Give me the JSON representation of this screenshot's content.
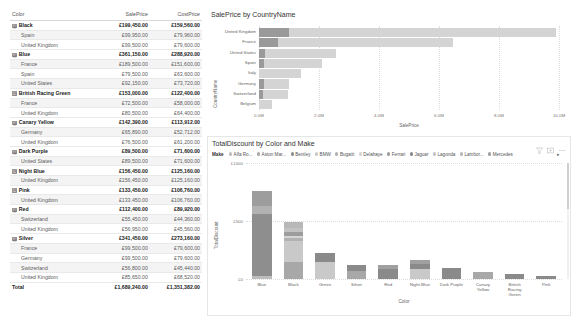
{
  "matrix": {
    "columns": [
      "Color",
      "SalePrice",
      "CostPrice"
    ],
    "rows": [
      {
        "type": "group",
        "label": "Black",
        "sale": "£199,450.00",
        "cost": "£159,560.00"
      },
      {
        "type": "sub",
        "label": "Spain",
        "sale": "£99,950.00",
        "cost": "£79,960.00"
      },
      {
        "type": "sub",
        "label": "United Kingdom",
        "sale": "£99,500.00",
        "cost": "£79,600.00"
      },
      {
        "type": "group",
        "label": "Blue",
        "sale": "£361,150.00",
        "cost": "£288,920.00"
      },
      {
        "type": "sub",
        "label": "France",
        "sale": "£189,500.00",
        "cost": "£151,600.00"
      },
      {
        "type": "sub",
        "label": "Spain",
        "sale": "£79,500.00",
        "cost": "£63,600.00"
      },
      {
        "type": "sub",
        "label": "United States",
        "sale": "£92,150.00",
        "cost": "£73,720.00"
      },
      {
        "type": "group",
        "label": "British Racing Green",
        "sale": "£153,000.00",
        "cost": "£122,400.00"
      },
      {
        "type": "sub",
        "label": "France",
        "sale": "£72,500.00",
        "cost": "£58,000.00"
      },
      {
        "type": "sub",
        "label": "United Kingdom",
        "sale": "£80,500.00",
        "cost": "£64,400.00"
      },
      {
        "type": "group",
        "label": "Canary Yellow",
        "sale": "£142,390.00",
        "cost": "£113,912.00"
      },
      {
        "type": "sub",
        "label": "Germany",
        "sale": "£65,890.00",
        "cost": "£52,712.00"
      },
      {
        "type": "sub",
        "label": "United Kingdom",
        "sale": "£76,500.00",
        "cost": "£61,200.00"
      },
      {
        "type": "group",
        "label": "Dark Purple",
        "sale": "£89,500.00",
        "cost": "£71,600.00"
      },
      {
        "type": "sub",
        "label": "United States",
        "sale": "£89,500.00",
        "cost": "£71,600.00"
      },
      {
        "type": "group",
        "label": "Night Blue",
        "sale": "£156,450.00",
        "cost": "£125,160.00"
      },
      {
        "type": "sub",
        "label": "United Kingdom",
        "sale": "£156,450.00",
        "cost": "£125,160.00"
      },
      {
        "type": "group",
        "label": "Pink",
        "sale": "£133,450.00",
        "cost": "£106,760.00"
      },
      {
        "type": "sub",
        "label": "United Kingdom",
        "sale": "£133,450.00",
        "cost": "£106,760.00"
      },
      {
        "type": "group",
        "label": "Red",
        "sale": "£112,400.00",
        "cost": "£89,920.00"
      },
      {
        "type": "sub",
        "label": "Switzerland",
        "sale": "£55,450.00",
        "cost": "£44,360.00"
      },
      {
        "type": "sub",
        "label": "United Kingdom",
        "sale": "£56,950.00",
        "cost": "£45,560.00"
      },
      {
        "type": "group",
        "label": "Silver",
        "sale": "£341,450.00",
        "cost": "£273,160.00"
      },
      {
        "type": "sub",
        "label": "France",
        "sale": "£99,500.00",
        "cost": "£79,600.00"
      },
      {
        "type": "sub",
        "label": "Germany",
        "sale": "£99,500.00",
        "cost": "£79,600.00"
      },
      {
        "type": "sub",
        "label": "Switzerland",
        "sale": "£56,800.00",
        "cost": "£45,440.00"
      },
      {
        "type": "sub",
        "label": "United Kingdom",
        "sale": "£85,650.00",
        "cost": "£68,520.00"
      },
      {
        "type": "total",
        "label": "Total",
        "sale": "£1,689,240.00",
        "cost": "£1,351,382.00"
      }
    ],
    "expander_glyph": "⊟"
  },
  "bar_visual": {
    "title": "SalePrice by CountryName",
    "chart_data": {
      "type": "bar",
      "orientation": "horizontal",
      "title": "SalePrice by CountryName",
      "xlabel": "SalePrice",
      "ylabel": "CountryName",
      "categories": [
        "United Kingdom",
        "France",
        "United States",
        "Spain",
        "Italy",
        "Germany",
        "Switzerland",
        "Belgium"
      ],
      "values": [
        9.9,
        6.45,
        2.55,
        2.1,
        1.4,
        1.0,
        0.95,
        0.42
      ],
      "highlight_values": [
        1.0,
        0.62,
        0.2,
        0.18,
        0.0,
        0.16,
        0.14,
        0.0
      ],
      "xlim": [
        0,
        10
      ],
      "xticks": [
        "0.0M",
        "2.0M",
        "4.0M",
        "6.0M",
        "8.0M",
        "10.0M"
      ],
      "xtick_values": [
        0,
        2,
        4,
        6,
        8,
        10
      ],
      "grid": true,
      "bar_color": "#d4d4d4",
      "highlight_color": "#9a9a9a"
    }
  },
  "column_visual": {
    "title": "TotalDiscount by Color and Make",
    "legend": {
      "title": "Make",
      "items": [
        {
          "label": "Alfa Ro...",
          "color": "#bdbdbd"
        },
        {
          "label": "Aston Mar...",
          "color": "#a8a8a8"
        },
        {
          "label": "Bentley",
          "color": "#8e8e8e"
        },
        {
          "label": "BMW",
          "color": "#c9c9c9"
        },
        {
          "label": "Bugatti",
          "color": "#b2b2b2"
        },
        {
          "label": "Delahaye",
          "color": "#d5d5d5"
        },
        {
          "label": "Ferrari",
          "color": "#9d9d9d"
        },
        {
          "label": "Jaguar",
          "color": "#8a8a8a"
        },
        {
          "label": "Lagonda",
          "color": "#c2c2c2"
        },
        {
          "label": "Lambor...",
          "color": "#b8b8b8"
        },
        {
          "label": "Mercedes",
          "color": "#a0a0a0"
        }
      ],
      "next_glyph": "▸"
    },
    "chart_data": {
      "type": "bar",
      "stacked": true,
      "title": "TotalDiscount by Color and Make",
      "xlabel": "Color",
      "ylabel": "TotalDiscount",
      "categories": [
        "Blue",
        "Black",
        "Green",
        "Silver",
        "Red",
        "Night Blue",
        "Dark Purple",
        "Canary Yellow",
        "British Racing Green",
        "Pink"
      ],
      "ylim": [
        0,
        1000
      ],
      "yticks": [
        "£0",
        "£500",
        "£1000"
      ],
      "ytick_values": [
        0,
        500,
        1000
      ],
      "grid": true,
      "series": [
        {
          "name": "Alfa Ro...",
          "values": [
            30,
            0,
            0,
            0,
            0,
            0,
            0,
            0,
            0,
            0
          ]
        },
        {
          "name": "Aston Mar...",
          "values": [
            0,
            150,
            0,
            70,
            0,
            0,
            0,
            60,
            0,
            0
          ]
        },
        {
          "name": "Bentley",
          "values": [
            530,
            0,
            0,
            0,
            0,
            0,
            0,
            0,
            0,
            0
          ]
        },
        {
          "name": "BMW",
          "values": [
            0,
            180,
            150,
            0,
            0,
            85,
            0,
            0,
            0,
            0
          ]
        },
        {
          "name": "Bugatti",
          "values": [
            70,
            25,
            0,
            0,
            0,
            0,
            0,
            0,
            0,
            0
          ]
        },
        {
          "name": "Delahaye",
          "values": [
            0,
            20,
            0,
            0,
            0,
            0,
            0,
            0,
            0,
            0
          ]
        },
        {
          "name": "Ferrari",
          "values": [
            130,
            30,
            0,
            0,
            0,
            0,
            0,
            0,
            0,
            0
          ]
        },
        {
          "name": "Jaguar",
          "values": [
            0,
            0,
            75,
            50,
            90,
            45,
            95,
            0,
            40,
            22
          ]
        },
        {
          "name": "Lagonda",
          "values": [
            0,
            35,
            0,
            0,
            0,
            0,
            0,
            0,
            0,
            0
          ]
        },
        {
          "name": "Lambor...",
          "values": [
            0,
            55,
            0,
            0,
            0,
            0,
            0,
            0,
            0,
            0
          ]
        },
        {
          "name": "Mercedes",
          "values": [
            0,
            0,
            0,
            0,
            30,
            35,
            0,
            0,
            0,
            0
          ]
        }
      ]
    }
  },
  "icons": {
    "filter": "filter-icon",
    "focus": "focus-mode-icon",
    "more": "more-options-icon"
  }
}
